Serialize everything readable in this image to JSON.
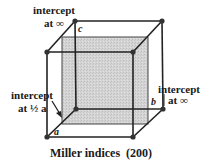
{
  "diagram": {
    "caption": "Miller indices  (200)",
    "labels": {
      "top_left_line1": "intercept",
      "top_left_line2": "at ∞",
      "right_line1": "intercept",
      "right_line2": "at ∞",
      "left_line1": "intercept",
      "left_line2": "at ½ a"
    },
    "axes": {
      "a": "a",
      "b": "b",
      "c": "c"
    },
    "colors": {
      "edge": "#222222",
      "plane_fill": "#cfcfcf",
      "vertex": "#333333"
    }
  }
}
